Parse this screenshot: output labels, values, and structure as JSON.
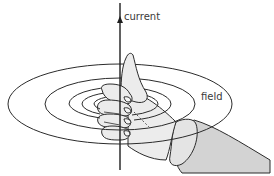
{
  "diagram": {
    "labels": {
      "current": "current",
      "field": "field"
    },
    "colors": {
      "stroke": "#2b2b2b",
      "hand_fill": "#ececec",
      "sleeve_fill": "#d3d3d3",
      "text": "#3a3a3a"
    },
    "wire": {
      "x": 120,
      "y_top": 3,
      "y_bottom": 170,
      "arrow_at_y": 20
    },
    "field_rings": [
      {
        "cx": 120,
        "cy": 104,
        "rx": 112,
        "ry": 40
      },
      {
        "cx": 120,
        "cy": 104,
        "rx": 75,
        "ry": 26
      },
      {
        "cx": 120,
        "cy": 104,
        "rx": 51,
        "ry": 17
      },
      {
        "cx": 120,
        "cy": 104,
        "rx": 38,
        "ry": 12
      },
      {
        "cx": 120,
        "cy": 104,
        "rx": 26,
        "ry": 8
      }
    ]
  }
}
